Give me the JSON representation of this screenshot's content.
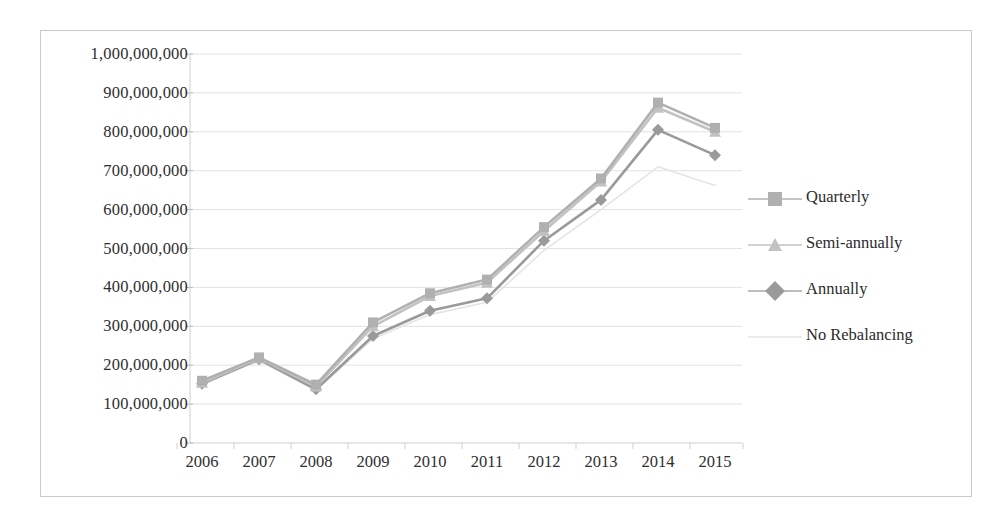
{
  "chart_data": {
    "type": "line",
    "title": "",
    "subtitle": "",
    "xlabel": "",
    "ylabel": "",
    "categories": [
      "2006",
      "2007",
      "2008",
      "2009",
      "2010",
      "2011",
      "2012",
      "2013",
      "2014",
      "2015"
    ],
    "xtick_labels": [
      "2006",
      "2007",
      "2008",
      "2009",
      "2010",
      "2011",
      "2012",
      "2013",
      "2014",
      "2015"
    ],
    "ytick_labels": [
      "1,000,000,000",
      "900,000,000",
      "800,000,000",
      "700,000,000",
      "600,000,000",
      "500,000,000",
      "400,000,000",
      "300,000,000",
      "200,000,000",
      "100,000,000",
      "0"
    ],
    "ytick_values": [
      1000000000,
      900000000,
      800000000,
      700000000,
      600000000,
      500000000,
      400000000,
      300000000,
      200000000,
      100000000,
      0
    ],
    "ylim": [
      0,
      1000000000
    ],
    "grid": true,
    "grid_axis": "y",
    "legend_position": "right",
    "series": [
      {
        "name": "Quarterly",
        "marker": "square",
        "color": "#b0b0b0",
        "values": [
          160000000,
          220000000,
          150000000,
          310000000,
          385000000,
          420000000,
          555000000,
          680000000,
          875000000,
          810000000
        ]
      },
      {
        "name": "Semi-annually",
        "marker": "triangle",
        "color": "#c2c2c2",
        "values": [
          155000000,
          218000000,
          145000000,
          300000000,
          378000000,
          412000000,
          545000000,
          672000000,
          862000000,
          800000000
        ]
      },
      {
        "name": "Annually",
        "marker": "diamond",
        "color": "#9a9a9a",
        "values": [
          152000000,
          215000000,
          138000000,
          275000000,
          340000000,
          372000000,
          520000000,
          625000000,
          805000000,
          740000000
        ]
      },
      {
        "name": "No Rebalancing",
        "marker": "none",
        "color": "#e4e4e4",
        "values": [
          150000000,
          212000000,
          135000000,
          268000000,
          330000000,
          362000000,
          495000000,
          600000000,
          710000000,
          662000000
        ]
      }
    ]
  },
  "legend": {
    "items": [
      {
        "label": "Quarterly"
      },
      {
        "label": "Semi-annually"
      },
      {
        "label": "Annually"
      },
      {
        "label": "No Rebalancing"
      }
    ]
  }
}
